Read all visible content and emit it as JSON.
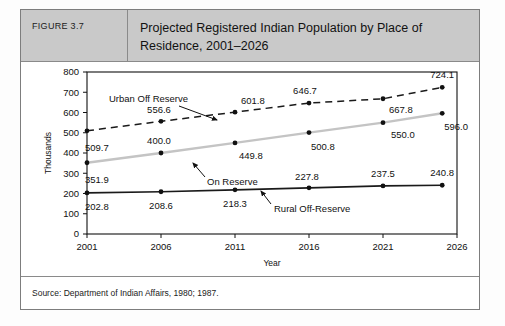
{
  "figure": {
    "number_label": "FIGURE 3.7",
    "title": "Projected Registered Indian Population by Place of Residence, 2001–2026",
    "source": "Source: Department of Indian Affairs, 1980; 1987."
  },
  "chart_data": {
    "type": "line",
    "title": "Projected Registered Indian Population by Place of Residence, 2001–2026",
    "xlabel": "Year",
    "ylabel": "Thousands",
    "xlim": [
      2001,
      2026
    ],
    "ylim": [
      0,
      800
    ],
    "xticks": [
      "2001",
      "2006",
      "2011",
      "2016",
      "2021",
      "2026"
    ],
    "yticks": [
      "0",
      "100",
      "200",
      "300",
      "400",
      "500",
      "600",
      "700",
      "800"
    ],
    "grid": false,
    "legend": "annotated-inline",
    "x": [
      2001,
      2006,
      2011,
      2016,
      2021,
      2025
    ],
    "series": [
      {
        "name": "Urban Off Reserve",
        "style": "dashed",
        "color": "#1a1a1a",
        "values": [
          509.7,
          556.6,
          601.8,
          646.7,
          667.8,
          724.1
        ],
        "labels": [
          "509.7",
          "556.6",
          "601.8",
          "646.7",
          "667.8",
          "724.1"
        ]
      },
      {
        "name": "On Reserve",
        "style": "solid-light",
        "color": "#c4c4c4",
        "values": [
          351.9,
          400.0,
          449.8,
          500.8,
          550.0,
          596.0
        ],
        "labels": [
          "351.9",
          "400.0",
          "449.8",
          "500.8",
          "550.0",
          "596.0"
        ]
      },
      {
        "name": "Rural Off-Reserve",
        "style": "solid",
        "color": "#1a1a1a",
        "values": [
          202.8,
          208.6,
          218.3,
          227.8,
          237.5,
          240.8
        ],
        "labels": [
          "202.8",
          "208.6",
          "218.3",
          "227.8",
          "237.5",
          "240.8"
        ]
      }
    ],
    "annotations": [
      {
        "text": "Urban Off Reserve",
        "series": "Urban Off Reserve"
      },
      {
        "text": "On Reserve",
        "series": "On Reserve"
      },
      {
        "text": "Rural Off-Reserve",
        "series": "Rural Off-Reserve"
      }
    ]
  }
}
